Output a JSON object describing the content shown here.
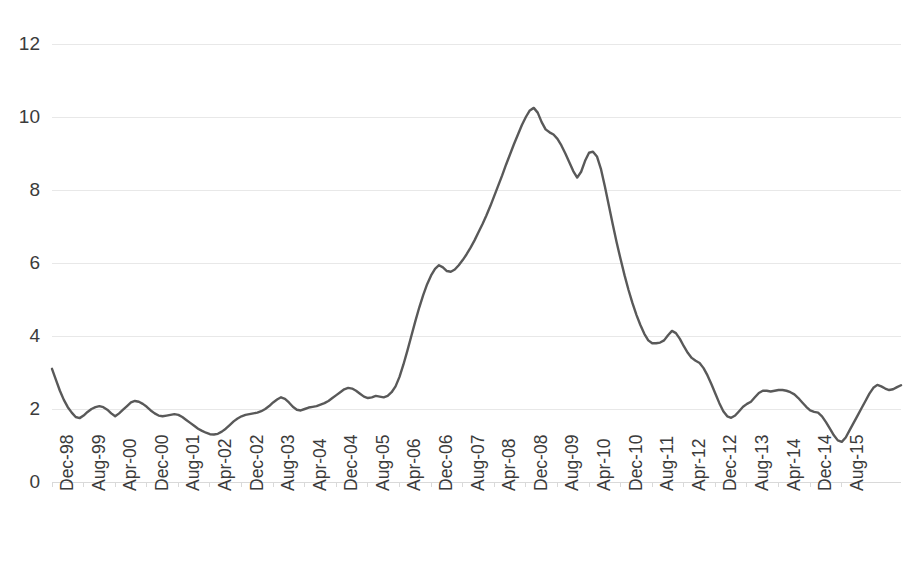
{
  "chart_data": {
    "type": "line",
    "title": "",
    "subtitle": "",
    "xlabel": "",
    "ylabel": "",
    "ylim": [
      0,
      12
    ],
    "yticks": [
      0,
      2,
      4,
      6,
      8,
      10,
      12
    ],
    "ytick_labels": [
      "0",
      "2",
      "4",
      "6",
      "8",
      "10",
      "12"
    ],
    "grid": true,
    "grid_axis": "y",
    "legend": false,
    "legend_position": "none",
    "line_color": "#595959",
    "line_width": 2.4,
    "x_tick_interval_months": 8,
    "x_tick_labels": [
      "Dec-98",
      "Aug-99",
      "Apr-00",
      "Dec-00",
      "Aug-01",
      "Apr-02",
      "Dec-02",
      "Aug-03",
      "Apr-04",
      "Dec-04",
      "Aug-05",
      "Apr-06",
      "Dec-06",
      "Aug-07",
      "Apr-08",
      "Dec-08",
      "Aug-09",
      "Apr-10",
      "Dec-10",
      "Aug-11",
      "Apr-12",
      "Dec-12",
      "Aug-13",
      "Apr-14",
      "Dec-14",
      "Aug-15"
    ],
    "x_start": "Dec-98",
    "x_end": "Dec-15",
    "series": [
      {
        "name": "series-1",
        "color": "#595959",
        "values": [
          3.1,
          2.8,
          2.5,
          2.25,
          2.05,
          1.9,
          1.78,
          1.75,
          1.82,
          1.92,
          2.0,
          2.05,
          2.08,
          2.05,
          1.98,
          1.88,
          1.8,
          1.88,
          1.98,
          2.08,
          2.18,
          2.22,
          2.2,
          2.14,
          2.06,
          1.96,
          1.88,
          1.82,
          1.8,
          1.82,
          1.84,
          1.86,
          1.84,
          1.78,
          1.7,
          1.62,
          1.54,
          1.46,
          1.4,
          1.35,
          1.31,
          1.3,
          1.32,
          1.38,
          1.46,
          1.56,
          1.66,
          1.74,
          1.8,
          1.84,
          1.86,
          1.88,
          1.9,
          1.94,
          2.0,
          2.08,
          2.18,
          2.26,
          2.32,
          2.28,
          2.18,
          2.06,
          1.98,
          1.96,
          2.0,
          2.04,
          2.06,
          2.08,
          2.12,
          2.16,
          2.22,
          2.3,
          2.38,
          2.46,
          2.54,
          2.58,
          2.56,
          2.5,
          2.42,
          2.34,
          2.3,
          2.32,
          2.36,
          2.34,
          2.32,
          2.36,
          2.46,
          2.62,
          2.88,
          3.22,
          3.6,
          4.0,
          4.4,
          4.78,
          5.12,
          5.42,
          5.66,
          5.84,
          5.94,
          5.88,
          5.78,
          5.76,
          5.82,
          5.94,
          6.08,
          6.24,
          6.42,
          6.62,
          6.84,
          7.06,
          7.3,
          7.56,
          7.84,
          8.12,
          8.4,
          8.7,
          8.98,
          9.26,
          9.52,
          9.78,
          10.0,
          10.18,
          10.25,
          10.12,
          9.86,
          9.66,
          9.58,
          9.52,
          9.4,
          9.22,
          9.0,
          8.76,
          8.52,
          8.34,
          8.5,
          8.8,
          9.02,
          9.05,
          8.92,
          8.58,
          8.1,
          7.58,
          7.06,
          6.56,
          6.1,
          5.66,
          5.26,
          4.9,
          4.58,
          4.3,
          4.06,
          3.88,
          3.8,
          3.8,
          3.82,
          3.88,
          4.02,
          4.14,
          4.08,
          3.92,
          3.72,
          3.54,
          3.4,
          3.32,
          3.26,
          3.12,
          2.92,
          2.68,
          2.42,
          2.16,
          1.94,
          1.8,
          1.76,
          1.82,
          1.94,
          2.06,
          2.14,
          2.2,
          2.32,
          2.44,
          2.5,
          2.5,
          2.48,
          2.5,
          2.52,
          2.52,
          2.5,
          2.46,
          2.4,
          2.3,
          2.18,
          2.06,
          1.96,
          1.92,
          1.9,
          1.8,
          1.64,
          1.46,
          1.28,
          1.14,
          1.1,
          1.22,
          1.42,
          1.62,
          1.82,
          2.02,
          2.22,
          2.42,
          2.58,
          2.66,
          2.62,
          2.56,
          2.52,
          2.54,
          2.6,
          2.65
        ]
      }
    ]
  }
}
